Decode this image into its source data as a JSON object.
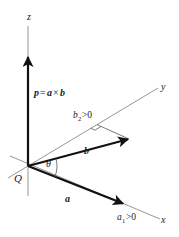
{
  "diagram": {
    "title": "",
    "origin": {
      "label": "Q",
      "x": 28,
      "y": 166
    },
    "axes": {
      "x": {
        "label": "x",
        "from": [
          10,
          156
        ],
        "to": [
          160,
          219
        ]
      },
      "y": {
        "label": "y",
        "from": [
          8,
          178
        ],
        "to": [
          158,
          88
        ]
      },
      "z": {
        "label": "z",
        "from": [
          28,
          196
        ],
        "to": [
          28,
          26
        ]
      }
    },
    "vectors": {
      "a": {
        "label": "a",
        "tip": [
          124,
          204
        ]
      },
      "b": {
        "label": "b",
        "tip": [
          129,
          139
        ]
      },
      "p": {
        "label": "p = a × b",
        "tip": [
          28,
          56
        ]
      }
    },
    "labels": {
      "z_axis": "z",
      "y_axis": "y",
      "x_axis": "x",
      "origin": "Q",
      "theta": "θ",
      "vec_a": "a",
      "vec_b": "b",
      "p_part": "p",
      "eq": "=",
      "a_part": "a",
      "times": "×",
      "b_part": "b",
      "b2_base": "b",
      "b2_sub": "2",
      "b2_rest": ">0",
      "a1_base": "a",
      "a1_sub": "1",
      "a1_rest": ">0"
    },
    "colors": {
      "axis": "#8a8a8a",
      "vector": "#111111",
      "text": "#222222"
    }
  }
}
